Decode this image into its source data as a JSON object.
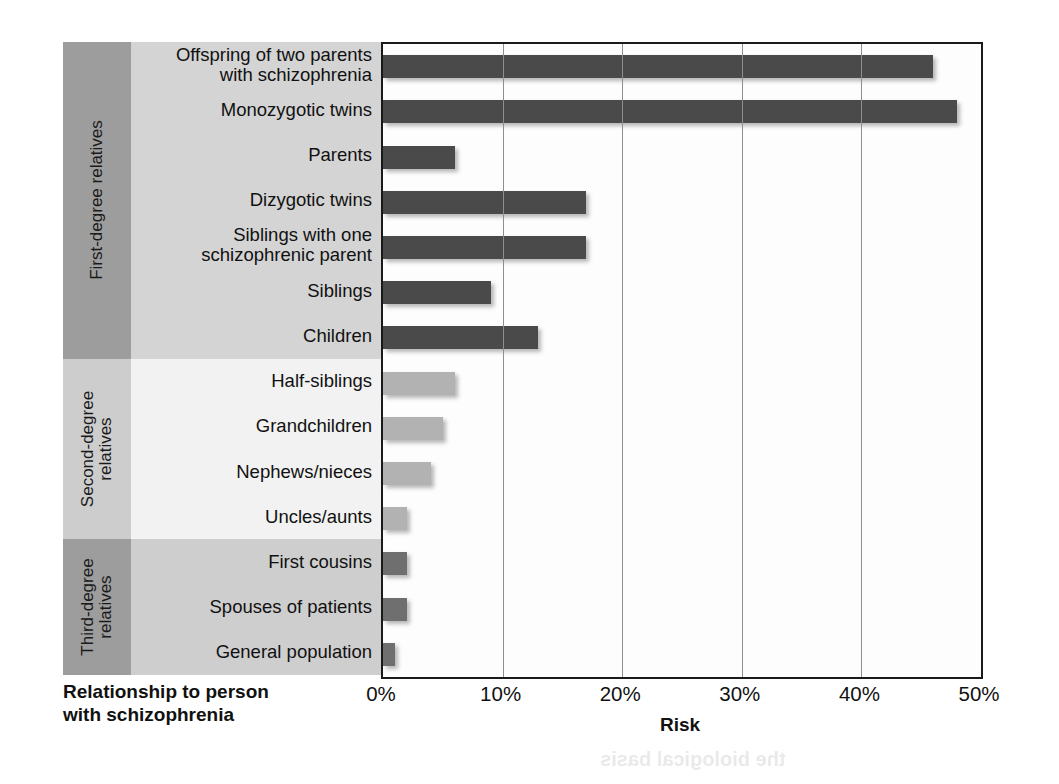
{
  "figure": {
    "y_axis_title_line1": "Relationship to person",
    "y_axis_title_line2": "with schizophrenia",
    "x_axis_title": "Risk"
  },
  "groups": [
    {
      "id": "first-degree",
      "label_line1": "First-degree relatives",
      "label_line2": "",
      "band_color": "#9d9d9d",
      "row_color": "#d4d4d4",
      "bar_color": "#4a4a4a",
      "count": 7
    },
    {
      "id": "second-degree",
      "label_line1": "Second-degree",
      "label_line2": "relatives",
      "band_color": "#cdcdcd",
      "row_color": "#f2f2f2",
      "bar_color": "#b2b2b2",
      "count": 4
    },
    {
      "id": "third-degree",
      "label_line1": "Third-degree",
      "label_line2": "relatives",
      "band_color": "#9d9d9d",
      "row_color": "#cecece",
      "bar_color": "#6f6f6f",
      "count": 3
    }
  ],
  "chart_data": {
    "type": "bar",
    "orientation": "horizontal",
    "title": "",
    "xlabel": "Risk",
    "ylabel": "Relationship to person with schizophrenia",
    "xlim": [
      0,
      50
    ],
    "xticks": [
      0,
      10,
      20,
      30,
      40,
      50
    ],
    "xticklabels": [
      "0%",
      "10%",
      "20%",
      "30%",
      "40%",
      "50%"
    ],
    "grid": "vertical",
    "legend": "none",
    "unit": "%",
    "categories": [
      "Offspring of two parents with schizophrenia",
      "Monozygotic twins",
      "Parents",
      "Dizygotic twins",
      "Siblings with one schizophrenic parent",
      "Siblings",
      "Children",
      "Half-siblings",
      "Grandchildren",
      "Nephews/nieces",
      "Uncles/aunts",
      "First cousins",
      "Spouses of patients",
      "General population"
    ],
    "values": [
      46,
      48,
      6,
      17,
      17,
      9,
      13,
      6,
      5,
      4,
      2,
      2,
      2,
      1
    ]
  },
  "rows": [
    {
      "label_line1": "Offspring of two parents",
      "label_line2": "with schizophrenia",
      "value": 46,
      "group": "first-degree"
    },
    {
      "label_line1": "Monozygotic twins",
      "label_line2": "",
      "value": 48,
      "group": "first-degree"
    },
    {
      "label_line1": "Parents",
      "label_line2": "",
      "value": 6,
      "group": "first-degree"
    },
    {
      "label_line1": "Dizygotic twins",
      "label_line2": "",
      "value": 17,
      "group": "first-degree"
    },
    {
      "label_line1": "Siblings with one",
      "label_line2": "schizophrenic parent",
      "value": 17,
      "group": "first-degree"
    },
    {
      "label_line1": "Siblings",
      "label_line2": "",
      "value": 9,
      "group": "first-degree"
    },
    {
      "label_line1": "Children",
      "label_line2": "",
      "value": 13,
      "group": "first-degree"
    },
    {
      "label_line1": "Half-siblings",
      "label_line2": "",
      "value": 6,
      "group": "second-degree"
    },
    {
      "label_line1": "Grandchildren",
      "label_line2": "",
      "value": 5,
      "group": "second-degree"
    },
    {
      "label_line1": "Nephews/nieces",
      "label_line2": "",
      "value": 4,
      "group": "second-degree"
    },
    {
      "label_line1": "Uncles/aunts",
      "label_line2": "",
      "value": 2,
      "group": "second-degree"
    },
    {
      "label_line1": "First cousins",
      "label_line2": "",
      "value": 2,
      "group": "third-degree"
    },
    {
      "label_line1": "Spouses of patients",
      "label_line2": "",
      "value": 2,
      "group": "third-degree"
    },
    {
      "label_line1": "General population",
      "label_line2": "",
      "value": 1,
      "group": "third-degree"
    }
  ],
  "bleed_text": [
    {
      "text": "POSITIVE SYMPTOMS",
      "x": 610,
      "y": 208,
      "size": 27
    },
    {
      "text": "People with schizophrenia often",
      "x": 600,
      "y": 258,
      "size": 18
    },
    {
      "text": "experience hallucinations and",
      "x": 600,
      "y": 288,
      "size": 18
    },
    {
      "text": "delusions during episodes",
      "x": 600,
      "y": 318,
      "size": 18
    },
    {
      "text": "of psychosis",
      "x": 600,
      "y": 348,
      "size": 18
    },
    {
      "text": "commonly hear voices",
      "x": 600,
      "y": 438,
      "size": 18
    },
    {
      "text": "the biological basis",
      "x": 600,
      "y": 748,
      "size": 20
    }
  ]
}
